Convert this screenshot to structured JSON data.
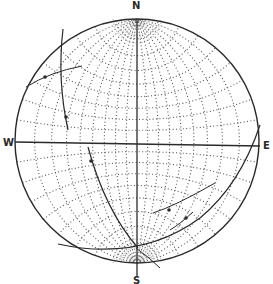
{
  "diagram": {
    "type": "stereonet (Wulff equal-angle net)",
    "labels": {
      "north": "N",
      "south": "S",
      "west": "W",
      "east": "E"
    },
    "colors": {
      "ink": "#2a2a2a",
      "grid": "#555555",
      "background": "#ffffff"
    },
    "geometry": {
      "cx": 137,
      "cy": 141,
      "radius": 122,
      "grid_interval_deg": 10
    },
    "great_circles": [
      {
        "name": "plane-a",
        "description": "steep curve from upper-left rim down through west-center"
      },
      {
        "name": "plane-b",
        "description": "curve from west-center toward south pole"
      },
      {
        "name": "plane-c",
        "description": "curve from lower-left rim through south to east rim"
      }
    ],
    "traces": [
      {
        "name": "short-trace-upper-left",
        "description": "short line near NW rim"
      },
      {
        "name": "short-trace-lower-right-1",
        "description": "short line in SE quadrant"
      },
      {
        "name": "short-trace-lower-right-2",
        "description": "short line in SE quadrant"
      }
    ],
    "points": [
      {
        "x": 45,
        "y": 77
      },
      {
        "x": 66,
        "y": 117
      },
      {
        "x": 91,
        "y": 161
      },
      {
        "x": 169,
        "y": 210
      },
      {
        "x": 186,
        "y": 218
      }
    ]
  }
}
